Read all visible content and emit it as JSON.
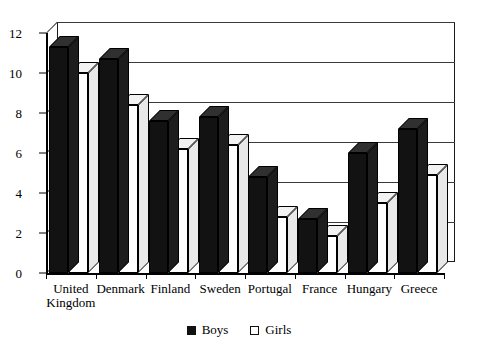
{
  "chart_data": {
    "type": "bar",
    "title": "",
    "subtitle": "",
    "xlabel": "",
    "ylabel": "",
    "ylim": [
      0,
      12
    ],
    "ytick_step": 2,
    "yticks": [
      0,
      2,
      4,
      6,
      8,
      10,
      12
    ],
    "ytick_labels": [
      "0",
      "2",
      "4",
      "6",
      "8",
      "10",
      "12"
    ],
    "grid": true,
    "grid_axis": "y",
    "legend_position": "bottom-center",
    "style": "3d-column",
    "categories": [
      "United\nKingdom",
      "Denmark",
      "Finland",
      "Sweden",
      "Portugal",
      "France",
      "Hungary",
      "Greece"
    ],
    "series": [
      {
        "name": "Boys",
        "color": "#121212",
        "values": [
          11.3,
          10.7,
          7.6,
          7.8,
          4.8,
          2.7,
          6.0,
          7.2
        ]
      },
      {
        "name": "Girls",
        "color": "#ffffff",
        "values": [
          10.0,
          8.4,
          6.2,
          6.4,
          2.8,
          1.85,
          3.5,
          4.9
        ]
      }
    ]
  },
  "legend": {
    "items": [
      {
        "label": "Boys",
        "swatch": "filled-black-square"
      },
      {
        "label": "Girls",
        "swatch": "outlined-white-square"
      }
    ]
  }
}
